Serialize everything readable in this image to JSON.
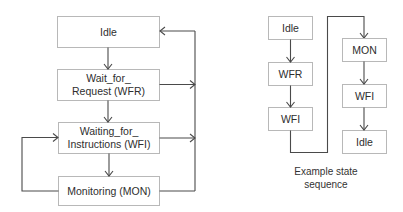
{
  "diagram": {
    "state_machine": {
      "states": [
        {
          "id": "idle",
          "lines": [
            "Idle"
          ]
        },
        {
          "id": "wfr",
          "lines": [
            "Wait_for_",
            "Request (WFR)"
          ]
        },
        {
          "id": "wfi",
          "lines": [
            "Waiting_for_",
            "Instructions (WFI)"
          ]
        },
        {
          "id": "mon",
          "lines": [
            "Monitoring (MON)"
          ]
        }
      ],
      "transitions": [
        {
          "from": "idle",
          "to": "wfr"
        },
        {
          "from": "wfr",
          "to": "wfi"
        },
        {
          "from": "wfi",
          "to": "mon"
        },
        {
          "from": "mon",
          "to": "wfi"
        },
        {
          "from": "wfr",
          "to": "idle"
        },
        {
          "from": "wfi",
          "to": "idle"
        },
        {
          "from": "mon",
          "to": "idle"
        }
      ]
    },
    "example_sequence": {
      "column1": [
        "Idle",
        "WFR",
        "WFI"
      ],
      "column2": [
        "MON",
        "WFI",
        "Idle"
      ],
      "caption_lines": [
        "Example state",
        "sequence"
      ]
    }
  }
}
